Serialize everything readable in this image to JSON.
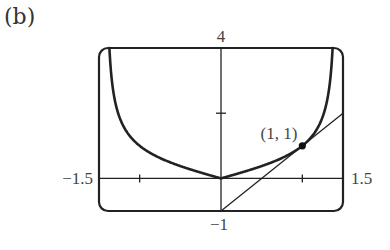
{
  "panel_label": "(b)",
  "chart_data": {
    "type": "line",
    "title": "",
    "xlabel": "",
    "ylabel": "",
    "xlim": [
      -1.5,
      1.5
    ],
    "ylim": [
      -1,
      4
    ],
    "grid": false,
    "x_tick_labels": [
      "-1.5",
      "1.5"
    ],
    "y_tick_labels": [
      "4",
      "-1"
    ],
    "x_ticks": [
      -1,
      1
    ],
    "y_ticks": [
      2
    ],
    "series": [
      {
        "name": "curve",
        "description": "y = |x| / sqrt(2 - x^2)",
        "x": [
          -1.38,
          -1.35,
          -1.3,
          -1.25,
          -1.2,
          -1.1,
          -1.0,
          -0.9,
          -0.8,
          -0.7,
          -0.6,
          -0.5,
          -0.4,
          -0.3,
          -0.2,
          -0.1,
          0.0,
          0.1,
          0.2,
          0.3,
          0.4,
          0.5,
          0.6,
          0.7,
          0.8,
          0.9,
          1.0,
          1.1,
          1.2,
          1.25,
          1.3,
          1.35,
          1.38
        ],
        "y": [
          4.47,
          3.21,
          2.34,
          1.89,
          1.6,
          1.24,
          1.0,
          0.83,
          0.69,
          0.57,
          0.47,
          0.38,
          0.29,
          0.22,
          0.14,
          0.07,
          0.0,
          0.07,
          0.14,
          0.22,
          0.29,
          0.38,
          0.47,
          0.57,
          0.69,
          0.83,
          1.0,
          1.24,
          1.6,
          1.89,
          2.34,
          3.21,
          4.47
        ]
      },
      {
        "name": "tangent line",
        "description": "y = 2x - 1",
        "x": [
          0,
          1.5
        ],
        "y": [
          -1,
          2
        ]
      }
    ],
    "annotations": [
      {
        "text": "(1, 1)",
        "x": 1,
        "y": 1,
        "marker": "point"
      }
    ]
  }
}
